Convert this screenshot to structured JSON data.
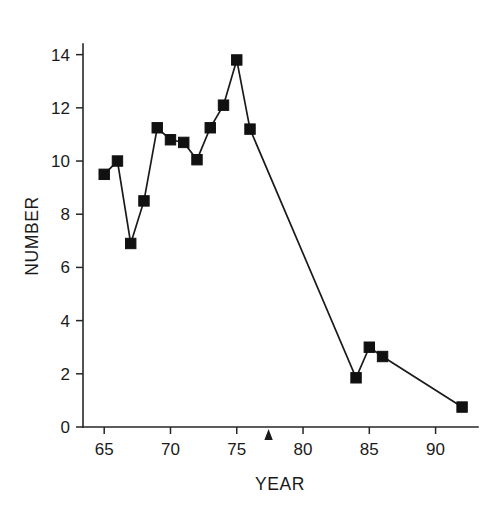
{
  "chart_data": {
    "type": "line",
    "title": "",
    "xlabel": "YEAR",
    "ylabel": "NUMBER",
    "xlim": [
      63.4,
      93.2
    ],
    "ylim": [
      0,
      14.4
    ],
    "grid": false,
    "legend": null,
    "x_ticks": [
      65,
      70,
      75,
      80,
      85,
      90
    ],
    "y_ticks": [
      0,
      2,
      4,
      6,
      8,
      10,
      12,
      14
    ],
    "x_tick_labels": [
      "65",
      "70",
      "75",
      "80",
      "85",
      "90"
    ],
    "y_tick_labels": [
      "0",
      "2",
      "4",
      "6",
      "8",
      "10",
      "12",
      "14"
    ],
    "marker_style": "filled-square",
    "series": [
      {
        "name": "number",
        "x": [
          65,
          66,
          67,
          68,
          69,
          70,
          71,
          72,
          73,
          74,
          75,
          76,
          84,
          85,
          86,
          92
        ],
        "values": [
          9.5,
          10.0,
          6.9,
          8.5,
          11.25,
          10.8,
          10.7,
          10.05,
          11.25,
          12.1,
          13.8,
          11.2,
          1.85,
          3.0,
          2.65,
          0.75
        ]
      }
    ],
    "annotations": [
      {
        "name": "axis-pointer-triangle",
        "shape": "triangle-up",
        "x": 77.4,
        "y": 0,
        "label": ""
      }
    ],
    "colors": {
      "line": "#1a1a1a",
      "marker": "#111111",
      "axis": "#262626",
      "background": "#ffffff"
    }
  },
  "axes": {
    "x_title": "YEAR",
    "y_title": "NUMBER"
  }
}
